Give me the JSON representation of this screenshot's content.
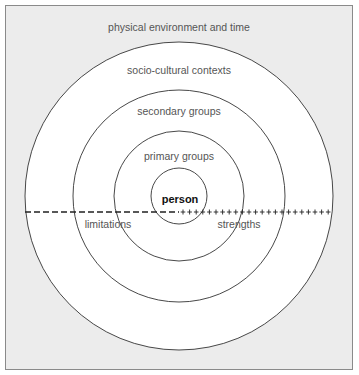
{
  "diagram": {
    "rings": [
      {
        "label": "physical environment and time"
      },
      {
        "label": "socio-cultural contexts"
      },
      {
        "label": "secondary groups"
      },
      {
        "label": "primary groups"
      },
      {
        "label": "person"
      }
    ],
    "axis": {
      "left_label": "limitations",
      "right_label": "strengths",
      "left_style": "dashed",
      "right_style": "plus-marks"
    },
    "colors": {
      "background": "#ececec",
      "rings": "#ffffff",
      "stroke": "#333333"
    }
  }
}
